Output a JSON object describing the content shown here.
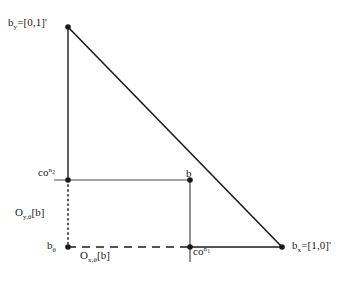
{
  "figure": {
    "kind": "geometric-diagram",
    "background_color": "#ffffff",
    "stroke_color": "#1a1a1a"
  },
  "labels": {
    "vertex_top": {
      "base": "b",
      "sub": "y",
      "rest": "=[0,1]'"
    },
    "vertex_right": {
      "base": "b",
      "sub": "x",
      "rest": "=[1,0]'"
    },
    "point_b": {
      "base": "b"
    },
    "co_n2": {
      "base": "co",
      "sup": "n",
      "sup_sub": "2"
    },
    "co_n1": {
      "base": "co",
      "sup": "n",
      "sup_sub": "1"
    },
    "origin": {
      "base": "b",
      "sub": "θ"
    },
    "o_y": {
      "base": "O",
      "sub": "y,θ",
      "rest": "[b]"
    },
    "o_x": {
      "base": "O",
      "sub": "x,θ",
      "rest": "[b]"
    }
  },
  "geometry": {
    "points": {
      "apex": {
        "x": 68,
        "y": 27
      },
      "right_vertex": {
        "x": 282,
        "y": 247
      },
      "origin": {
        "x": 68,
        "y": 247
      },
      "b": {
        "x": 190,
        "y": 180
      },
      "co_n2_point": {
        "x": 68,
        "y": 180
      },
      "co_n1_point": {
        "x": 190,
        "y": 247
      }
    },
    "segments": [
      {
        "name": "left-leg",
        "style": "solid"
      },
      {
        "name": "hypotenuse",
        "style": "solid"
      },
      {
        "name": "horizontal-through-b",
        "style": "solid"
      },
      {
        "name": "vertical-b-to-base",
        "style": "solid"
      },
      {
        "name": "base-right",
        "style": "solid"
      },
      {
        "name": "base-dashed",
        "style": "dashed"
      },
      {
        "name": "left-dotted",
        "style": "dotted"
      }
    ],
    "dot_radius": 2.6
  }
}
